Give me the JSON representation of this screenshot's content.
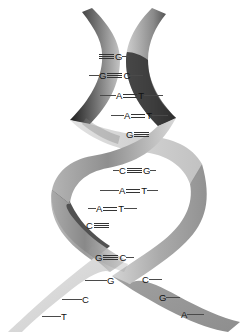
{
  "figure": {
    "strands": [
      {
        "id": "left-strand",
        "name": "left backbone ribbon",
        "shade": "#c9c9c9"
      },
      {
        "id": "right-strand",
        "name": "right backbone ribbon",
        "shade": "#9a9a9a"
      }
    ],
    "colors": {
      "background": "#ffffff",
      "ribbon_light": "#dcdcdc",
      "ribbon_mid": "#a8a8a8",
      "ribbon_dark": "#3a3a3a",
      "ribbon_darkest": "#141414",
      "text": "#111111",
      "bond_line": "#333333",
      "tick_line": "#4a4a4a"
    },
    "bond_legend": {
      "triple": "≡",
      "double": "=",
      "triple_meaning": "G–C pair, three hydrogen bonds",
      "double_meaning": "A–T pair, two hydrogen bonds"
    }
  },
  "base_pairs": [
    {
      "index": 1,
      "left": "",
      "bond": "triple",
      "right": "G",
      "left_tick": 0,
      "right_tick": 7,
      "x": 98,
      "y": 52,
      "occluded": "left",
      "note": "C partially hidden behind crossing ribbon"
    },
    {
      "index": 2,
      "left": "G",
      "bond": "triple",
      "right": "C",
      "left_tick": 10,
      "right_tick": 13,
      "x": 89,
      "y": 71,
      "occluded": "none",
      "note": ""
    },
    {
      "index": 3,
      "left": "A",
      "bond": "double",
      "right": "T",
      "left_tick": 16,
      "right_tick": 19,
      "x": 100,
      "y": 91,
      "occluded": "none",
      "note": ""
    },
    {
      "index": 4,
      "left": "A",
      "bond": "double",
      "right": "T",
      "left_tick": 13,
      "right_tick": 16,
      "x": 111,
      "y": 111,
      "occluded": "none",
      "note": ""
    },
    {
      "index": 5,
      "left": "G",
      "bond": "triple",
      "right": "",
      "left_tick": 0,
      "right_tick": 0,
      "x": 126,
      "y": 130,
      "occluded": "right",
      "note": "C hidden behind crossing ribbon"
    },
    {
      "index": 6,
      "left": "C",
      "bond": "triple",
      "right": "G",
      "left_tick": 6,
      "right_tick": 6,
      "x": 113,
      "y": 166,
      "occluded": "none",
      "note": ""
    },
    {
      "index": 7,
      "left": "A",
      "bond": "double",
      "right": "T",
      "left_tick": 19,
      "right_tick": 11,
      "x": 100,
      "y": 186,
      "occluded": "none",
      "note": ""
    },
    {
      "index": 8,
      "left": "A",
      "bond": "double",
      "right": "T",
      "left_tick": 8,
      "right_tick": 13,
      "x": 88,
      "y": 204,
      "occluded": "none",
      "note": ""
    },
    {
      "index": 9,
      "left": "C",
      "bond": "triple",
      "right": "",
      "left_tick": 0,
      "right_tick": 0,
      "x": 86,
      "y": 221,
      "occluded": "right",
      "note": "G hidden behind crossing ribbon"
    },
    {
      "index": 10,
      "left": "G",
      "bond": "triple",
      "right": "C",
      "left_tick": 0,
      "right_tick": 8,
      "x": 95,
      "y": 253,
      "occluded": "none",
      "note": ""
    }
  ],
  "unpaired_bases": {
    "left_strand": [
      {
        "base": "G",
        "x": 85,
        "y": 276,
        "tick": 22,
        "tick_side": "left"
      },
      {
        "base": "C",
        "x": 62,
        "y": 295,
        "tick": 20,
        "tick_side": "left"
      },
      {
        "base": "T",
        "x": 42,
        "y": 312,
        "tick": 19,
        "tick_side": "left"
      }
    ],
    "right_strand": [
      {
        "base": "C",
        "x": 142,
        "y": 275,
        "tick": 13,
        "tick_side": "right"
      },
      {
        "base": "G",
        "x": 159,
        "y": 293,
        "tick": 14,
        "tick_side": "right"
      },
      {
        "base": "A",
        "x": 181,
        "y": 310,
        "tick": 17,
        "tick_side": "right"
      }
    ]
  }
}
